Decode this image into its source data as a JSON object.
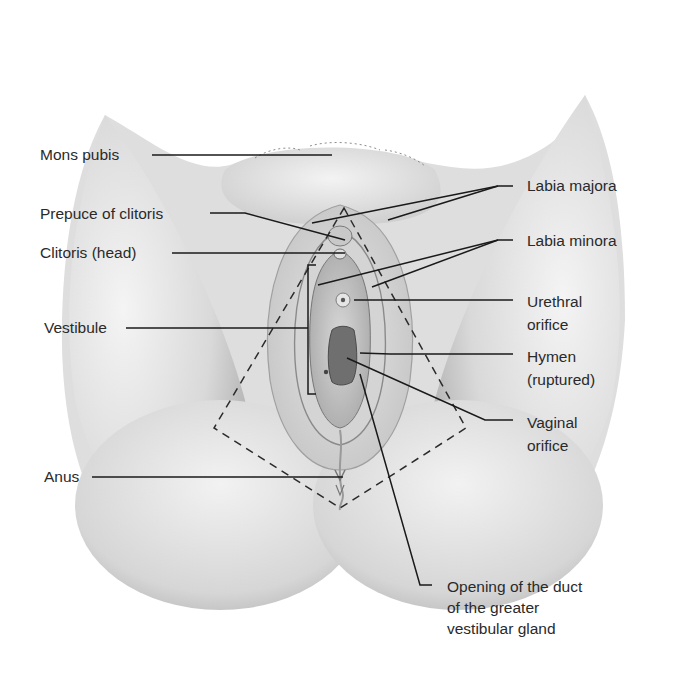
{
  "figure": {
    "type": "anatomical-diagram",
    "colors": {
      "skin_light": "#ececec",
      "skin_mid": "#d2d2d2",
      "skin_dark": "#a9a9a9",
      "line": "#1e1e1e",
      "text": "#2a2a2a"
    }
  },
  "labels": {
    "left": [
      {
        "id": "mons-pubis",
        "text": "Mons pubis"
      },
      {
        "id": "prepuce-of-clitoris",
        "text": "Prepuce of clitoris"
      },
      {
        "id": "clitoris-head",
        "text": "Clitoris (head)"
      },
      {
        "id": "vestibule",
        "text": "Vestibule"
      },
      {
        "id": "anus",
        "text": "Anus"
      }
    ],
    "right": [
      {
        "id": "labia-majora",
        "text": "Labia majora"
      },
      {
        "id": "labia-minora",
        "text": "Labia minora"
      },
      {
        "id": "urethral-orifice",
        "text": "Urethral\norifice"
      },
      {
        "id": "hymen",
        "text": "Hymen\n(ruptured)"
      },
      {
        "id": "vaginal-orifice",
        "text": "Vaginal\norifice"
      }
    ],
    "bottom": [
      {
        "id": "greater-vestibular-gland-duct",
        "text": "Opening of the duct\nof the greater\nvestibular gland"
      }
    ]
  }
}
